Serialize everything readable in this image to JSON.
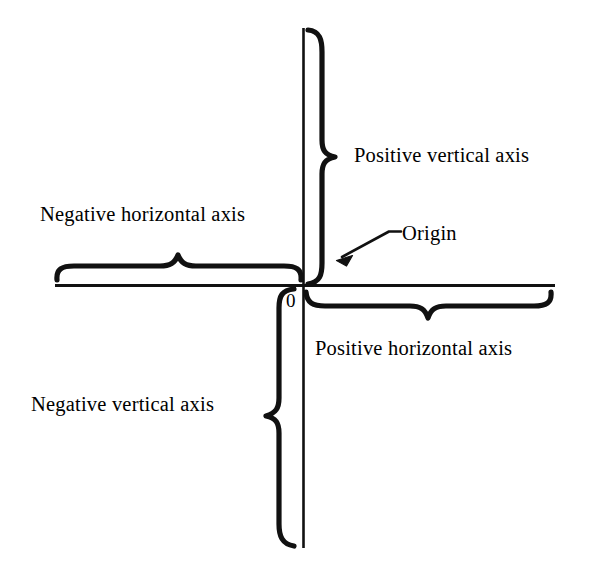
{
  "figure": {
    "background_color": "#ffffff",
    "ink_color": "#000000",
    "width": 592,
    "height": 567
  },
  "axes": {
    "vertical": {
      "name": "vertical axis",
      "x": 303,
      "y_top": 28,
      "y_bottom": 548
    },
    "horizontal": {
      "name": "horizontal axis",
      "y": 285,
      "x_left": 55,
      "x_right": 555
    },
    "origin": {
      "x": 303,
      "y": 285,
      "label": "0"
    }
  },
  "labels": {
    "positive_vertical": "Positive vertical axis",
    "negative_horizontal": "Negative horizontal axis",
    "positive_horizontal": "Positive horizontal axis",
    "negative_vertical": "Negative vertical axis",
    "origin": "Origin",
    "zero": "0"
  },
  "braces": [
    {
      "name": "positive-vertical-brace",
      "orientation": "vertical",
      "points_right": true,
      "from": 30,
      "to": 283,
      "tip": 157,
      "spine_x": 322
    },
    {
      "name": "negative-horizontal-brace",
      "orientation": "horizontal",
      "points_up": true,
      "from": 57,
      "to": 300,
      "tip": 178,
      "spine_y": 268
    },
    {
      "name": "positive-horizontal-brace",
      "orientation": "horizontal",
      "points_down": true,
      "from": 306,
      "to": 553,
      "tip": 428,
      "spine_y": 302
    },
    {
      "name": "negative-vertical-brace",
      "orientation": "vertical",
      "points_left": true,
      "from": 289,
      "to": 546,
      "tip": 416,
      "spine_x": 278
    }
  ],
  "leader": {
    "name": "origin-leader-arrow",
    "arrow_tip": [
      337,
      260
    ],
    "elbow": [
      389,
      231
    ],
    "end": [
      401,
      231
    ]
  }
}
